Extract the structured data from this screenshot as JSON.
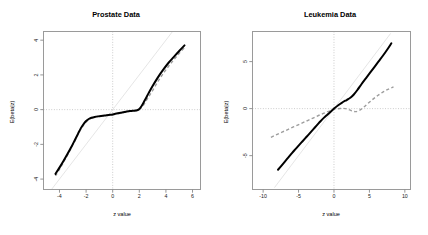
{
  "figure": {
    "background": "#ffffff",
    "panel_count": 2,
    "curve_color_solid": "#000000",
    "curve_color_dashed": "#9d9d9d",
    "reference_line_color": "#e2e2e2",
    "zero_gridline_color": "#b9b9b9",
    "frame_color": "#9a9a9a"
  },
  "chart_data": [
    {
      "type": "line",
      "panel": "left",
      "title": "Prostate Data",
      "xlabel": "z value",
      "ylabel": "E(beta|z)",
      "xlim": [
        -5.2,
        6.6
      ],
      "ylim": [
        -4.6,
        4.5
      ],
      "xticks": [
        -4,
        -2,
        0,
        2,
        4,
        6
      ],
      "yticks": [
        -4,
        -2,
        0,
        2,
        4
      ],
      "xticklabels": [
        "-4",
        "-2",
        "0",
        "2",
        "4",
        "6"
      ],
      "yticklabels": [
        "-4",
        "-2",
        "0",
        "2",
        "4"
      ],
      "grid": false,
      "zero_lines": {
        "horizontal": 0,
        "vertical": 0,
        "style": "dotted"
      },
      "identity_line": {
        "from": [
          -4.6,
          -4.6
        ],
        "to": [
          4.5,
          4.5
        ],
        "style": "solid",
        "color": "#e2e2e2"
      },
      "legend": null,
      "series": [
        {
          "name": "estimate",
          "style": "solid",
          "color": "#000000",
          "x": [
            -4.3,
            -4.0,
            -3.7,
            -3.4,
            -3.1,
            -2.85,
            -2.6,
            -2.4,
            -2.2,
            -2.0,
            -1.8,
            -1.6,
            -1.35,
            -1.0,
            -0.6,
            -0.2,
            0.2,
            0.6,
            1.0,
            1.3,
            1.55,
            1.75,
            1.95,
            2.15,
            2.4,
            2.7,
            3.0,
            3.4,
            3.8,
            4.2,
            4.6,
            5.0,
            5.4
          ],
          "y": [
            -3.7,
            -3.34,
            -2.96,
            -2.56,
            -2.14,
            -1.76,
            -1.38,
            -1.08,
            -0.84,
            -0.66,
            -0.54,
            -0.47,
            -0.42,
            -0.38,
            -0.34,
            -0.3,
            -0.24,
            -0.18,
            -0.12,
            -0.08,
            -0.06,
            -0.05,
            0.0,
            0.18,
            0.52,
            0.95,
            1.36,
            1.86,
            2.3,
            2.7,
            3.04,
            3.38,
            3.7
          ]
        },
        {
          "name": "comparison",
          "style": "dashed",
          "color": "#9d9d9d",
          "x": [
            -4.3,
            -4.0,
            -3.7,
            -3.4,
            -3.1,
            -2.85,
            -2.6,
            -2.4,
            -2.2,
            -2.0,
            -1.8,
            -1.55,
            -1.2,
            -0.8,
            -0.4,
            0.0,
            0.4,
            0.8,
            1.15,
            1.45,
            1.7,
            1.9,
            2.1,
            2.35,
            2.65,
            3.0,
            3.4,
            3.8,
            4.2,
            4.6,
            5.0,
            5.4
          ],
          "y": [
            -3.82,
            -3.44,
            -3.04,
            -2.62,
            -2.18,
            -1.8,
            -1.42,
            -1.14,
            -0.9,
            -0.72,
            -0.58,
            -0.47,
            -0.4,
            -0.36,
            -0.33,
            -0.3,
            -0.24,
            -0.17,
            -0.11,
            -0.07,
            -0.05,
            -0.02,
            0.06,
            0.3,
            0.68,
            1.1,
            1.62,
            2.08,
            2.5,
            2.88,
            3.24,
            3.58
          ]
        }
      ]
    },
    {
      "type": "line",
      "panel": "right",
      "title": "Leukemia Data",
      "xlabel": "z value",
      "ylabel": "E(beta|z)",
      "xlim": [
        -11.5,
        10.8
      ],
      "ylim": [
        -8.6,
        8.2
      ],
      "xticks": [
        -10,
        -5,
        0,
        5,
        10
      ],
      "yticks": [
        -5,
        0,
        5
      ],
      "xticklabels": [
        "-10",
        "-5",
        "0",
        "5",
        "10"
      ],
      "yticklabels": [
        "-5",
        "0",
        "5"
      ],
      "grid": false,
      "zero_lines": {
        "horizontal": 0,
        "vertical": 0,
        "style": "dotted"
      },
      "identity_line": {
        "from": [
          -8.4,
          -8.4
        ],
        "to": [
          8.0,
          8.0
        ],
        "style": "solid",
        "color": "#e2e2e2"
      },
      "legend": null,
      "series": [
        {
          "name": "estimate",
          "style": "solid",
          "color": "#000000",
          "x": [
            -7.9,
            -7.4,
            -6.9,
            -6.4,
            -5.9,
            -5.4,
            -4.9,
            -4.4,
            -3.9,
            -3.4,
            -2.9,
            -2.4,
            -1.9,
            -1.4,
            -0.9,
            -0.4,
            0.1,
            0.6,
            1.1,
            1.6,
            2.0,
            2.4,
            2.8,
            3.3,
            3.9,
            4.5,
            5.1,
            5.7,
            6.3,
            6.9,
            7.5,
            8.1
          ],
          "y": [
            -6.5,
            -6.05,
            -5.6,
            -5.15,
            -4.7,
            -4.28,
            -3.86,
            -3.44,
            -3.02,
            -2.6,
            -2.18,
            -1.76,
            -1.34,
            -0.96,
            -0.62,
            -0.28,
            0.06,
            0.36,
            0.62,
            0.84,
            1.0,
            1.2,
            1.5,
            1.98,
            2.62,
            3.22,
            3.82,
            4.42,
            5.02,
            5.62,
            6.26,
            6.95
          ]
        },
        {
          "name": "comparison",
          "style": "dashed",
          "color": "#9d9d9d",
          "x": [
            -8.9,
            -8.2,
            -7.5,
            -6.8,
            -6.1,
            -5.4,
            -4.7,
            -4.0,
            -3.3,
            -2.6,
            -1.9,
            -1.2,
            -0.5,
            0.2,
            0.9,
            1.6,
            2.2,
            2.7,
            3.1,
            3.6,
            4.2,
            4.9,
            5.6,
            6.3,
            7.0,
            7.7,
            8.4
          ],
          "y": [
            -3.05,
            -2.8,
            -2.56,
            -2.32,
            -2.08,
            -1.84,
            -1.6,
            -1.36,
            -1.12,
            -0.88,
            -0.64,
            -0.42,
            -0.22,
            -0.06,
            0.02,
            0.0,
            -0.14,
            -0.28,
            -0.32,
            -0.18,
            0.16,
            0.62,
            1.06,
            1.46,
            1.8,
            2.08,
            2.32
          ]
        }
      ]
    }
  ]
}
